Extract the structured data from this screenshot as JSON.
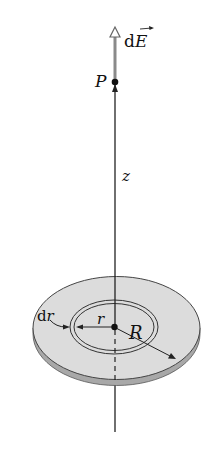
{
  "figure": {
    "labels": {
      "field_vector": "dE",
      "field_vector_d": "d",
      "field_vector_E": "E",
      "point": "P",
      "axis": "z",
      "ring_width": "dr",
      "ring_width_d": "d",
      "ring_width_r": "r",
      "ring_radius": "r",
      "disk_radius": "R"
    },
    "colors": {
      "disk_face": "#dcdcdc",
      "disk_edge": "#a8a8a8",
      "vector": "#8a8a8a",
      "line": "#222222"
    }
  }
}
